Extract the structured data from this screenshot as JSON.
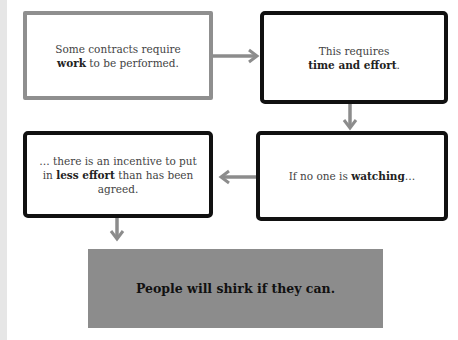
{
  "diagram": {
    "type": "flowchart",
    "colors": {
      "box_border_first": "#8f8f8f",
      "box_border_other": "#111111",
      "arrow": "#8c8c8c",
      "banner_bg": "#8c8c8c",
      "side_strip": "#e6e6e6"
    },
    "nodes": [
      {
        "id": "box1",
        "pre": "Some contracts require ",
        "bold": "work",
        "post": " to be performed."
      },
      {
        "id": "box2",
        "pre": "This requires ",
        "bold": "time and effort",
        "post": "."
      },
      {
        "id": "box4",
        "pre": "If no one is ",
        "bold": "watching",
        "post": "…"
      },
      {
        "id": "box3",
        "pre": "… there is an incentive to put in ",
        "bold": "less effort",
        "post": " than has been agreed."
      }
    ],
    "conclusion": "People will shirk if they can.",
    "edges": [
      {
        "from": "box1",
        "to": "box2",
        "direction": "right"
      },
      {
        "from": "box2",
        "to": "box4",
        "direction": "down"
      },
      {
        "from": "box4",
        "to": "box3",
        "direction": "left"
      },
      {
        "from": "box3",
        "to": "conclusion",
        "direction": "down"
      }
    ]
  }
}
